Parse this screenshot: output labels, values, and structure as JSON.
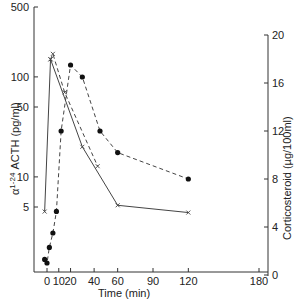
{
  "chart_data": {
    "type": "line",
    "title": "",
    "xlabel": "Time (min)",
    "ylabel_left": "α 1-24 ACTH (pg/ml)",
    "ylabel_right": "Corticosteroid (µg/100ml)",
    "x_ticks": [
      "0",
      "10",
      "20",
      "40",
      "60",
      "90",
      "120",
      "180"
    ],
    "y_left_ticks": [
      "500",
      "100",
      "50",
      "10",
      "5"
    ],
    "y_left_scale": "log",
    "y_right_ticks": [
      "20",
      "16",
      "12",
      "8",
      "4",
      "0"
    ],
    "y_right_scale": "linear",
    "xlim": [
      -5,
      185
    ],
    "ylim_left": [
      1,
      500
    ],
    "ylim_right": [
      0,
      20
    ],
    "series": [
      {
        "name": "α 1-24 ACTH",
        "axis": "left",
        "marker": "x",
        "line": "solid",
        "x": [
          -2,
          3,
          30,
          60,
          120
        ],
        "y": [
          4.5,
          150,
          20,
          5.2,
          4.4
        ]
      },
      {
        "name": "Corticosteroid",
        "axis": "right",
        "marker": "filled-circle",
        "line": "dashed",
        "x": [
          -2,
          0,
          2,
          5,
          8,
          12,
          20,
          30,
          45,
          60,
          120
        ],
        "y": [
          1.3,
          1.0,
          2.3,
          3.5,
          5.3,
          12.0,
          17.5,
          16.5,
          12.0,
          10.2,
          8.0
        ]
      },
      {
        "name": "ACTH peak (dashed)",
        "axis": "left",
        "marker": "x",
        "line": "dashed",
        "x": [
          3,
          5,
          15,
          43
        ],
        "y": [
          150,
          170,
          70,
          12.8
        ]
      }
    ],
    "grid": false,
    "legend": "none"
  },
  "axes": {
    "xlabel": "Time (min)",
    "ylabel_left_prefix": "α",
    "ylabel_left_sup": "1-24",
    "ylabel_left_rest": " ACTH (pg/ml)",
    "ylabel_right": "Corticosteroid (µg/100ml)"
  }
}
